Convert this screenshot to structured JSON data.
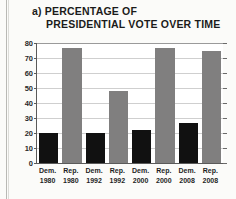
{
  "figure": {
    "panel_label": "a)",
    "background": "#fbfbf9"
  },
  "title": {
    "line1": "a) PERCENTAGE OF",
    "line2": "PRESIDENTIAL VOTE OVER TIME"
  },
  "colors": {
    "democrat_bar": "#111111",
    "republican_bar": "#807f7f",
    "gridline": "#cfcfcf",
    "axis": "#5a5a5a",
    "plot_background": "#ffffff",
    "text": "#1b1b1b"
  },
  "axis": {
    "y_ticks": [
      0,
      10,
      20,
      30,
      40,
      50,
      60,
      70,
      80
    ],
    "y_min": 0,
    "y_max": 80
  },
  "chart_data": {
    "type": "bar",
    "title": "a) PERCENTAGE OF PRESIDENTIAL VOTE OVER TIME",
    "xlabel": "",
    "ylabel": "",
    "ylim": [
      0,
      80
    ],
    "grid": true,
    "legend": "none",
    "categories": [
      "Dem. 1980",
      "Rep. 1980",
      "Dem. 1992",
      "Rep. 1992",
      "Dem. 2000",
      "Rep. 2000",
      "Dem. 2008",
      "Rep. 2008"
    ],
    "values": [
      20,
      77,
      20,
      48,
      22,
      77,
      27,
      75
    ],
    "bars": [
      {
        "party": "Dem.",
        "year": "1980",
        "value": 20,
        "color": "#111111"
      },
      {
        "party": "Rep.",
        "year": "1980",
        "value": 77,
        "color": "#807f7f"
      },
      {
        "party": "Dem.",
        "year": "1992",
        "value": 20,
        "color": "#111111"
      },
      {
        "party": "Rep.",
        "year": "1992",
        "value": 48,
        "color": "#807f7f"
      },
      {
        "party": "Dem.",
        "year": "2000",
        "value": 22,
        "color": "#111111"
      },
      {
        "party": "Rep.",
        "year": "2000",
        "value": 77,
        "color": "#807f7f"
      },
      {
        "party": "Dem.",
        "year": "2008",
        "value": 27,
        "color": "#111111"
      },
      {
        "party": "Rep.",
        "year": "2008",
        "value": 75,
        "color": "#807f7f"
      }
    ],
    "y_tick_labels": [
      "0",
      "10",
      "20",
      "30",
      "40",
      "50",
      "60",
      "70",
      "80"
    ]
  }
}
